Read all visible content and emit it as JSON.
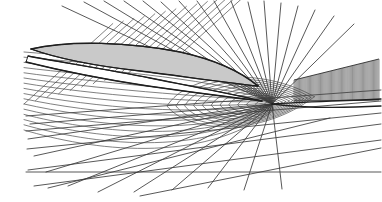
{
  "figure": {
    "title": "Perspective view of a curvilinear computational grid about an airfoil",
    "type": "technical-line-diagram",
    "width": 382,
    "height": 202,
    "background_color": "#ffffff",
    "line_color": "#3a3a3a",
    "heavy_line_color": "#1f1f1f",
    "body_fill_color": "#c9c9c9",
    "body_outline_color": "#2b2b2b",
    "hatch_color": "#4c4c4c"
  },
  "focus": {
    "name": "grid-convergence-point",
    "x": 272,
    "y": 104,
    "label": "singular focus"
  },
  "body": {
    "name": "airfoil-body",
    "fill": "#c9c9c9",
    "nose": {
      "x": 31,
      "y": 49
    },
    "tail": {
      "x": 258,
      "y": 86
    },
    "upper_path": "M31,49 C70,40 130,42 180,52 C212,59 240,71 258,86",
    "lower_path": "M258,86 C228,83 180,76 140,71 C96,66 56,58 31,49",
    "outline_path": "M31,49 C70,40 130,42 180,52 C212,59 240,71 258,86 C228,83 180,76 140,71 C96,66 56,58 31,49 Z"
  },
  "wake": {
    "name": "wake-sheet",
    "fill": "#ffffff",
    "path": "M28,56 C60,62 110,70 150,78 C190,86 232,94 262,101 C236,98 190,92 148,86 C108,80 58,70 26,62 Z",
    "upper_edge": "M28,56 C60,62 110,70 150,78 C190,86 232,94 262,101",
    "lower_edge": "M26,62 C58,70 108,80 148,86 C190,92 236,98 262,101"
  },
  "hatch_panel": {
    "name": "dense-hatched-wedge",
    "comment": "Dense vertical hatching at right, bounded by sloped top edge and near-horizontal bottom edge",
    "x_start": 294,
    "x_end": 379,
    "top_left": {
      "x": 294,
      "y": 80
    },
    "top_right": {
      "x": 379,
      "y": 59
    },
    "bottom_left": {
      "x": 294,
      "y": 101
    },
    "bottom_right": {
      "x": 379,
      "y": 100
    },
    "line_count": 78,
    "stroke_width": 0.6
  },
  "radial_fan_upper": {
    "name": "upper-radial-grid-lines",
    "comment": "Lines radiating up-left from the focus, crossing the body's upper surface and exiting the top of the frame",
    "count": 17,
    "end_points": [
      {
        "x": 62,
        "y": 6
      },
      {
        "x": 84,
        "y": 2
      },
      {
        "x": 104,
        "y": 1
      },
      {
        "x": 124,
        "y": 1
      },
      {
        "x": 143,
        "y": 1
      },
      {
        "x": 161,
        "y": 2
      },
      {
        "x": 179,
        "y": 1
      },
      {
        "x": 197,
        "y": 1
      },
      {
        "x": 214,
        "y": 1
      },
      {
        "x": 231,
        "y": 1
      },
      {
        "x": 248,
        "y": 2
      },
      {
        "x": 264,
        "y": 1
      },
      {
        "x": 281,
        "y": 3
      },
      {
        "x": 298,
        "y": 6
      },
      {
        "x": 315,
        "y": 10
      },
      {
        "x": 334,
        "y": 16
      },
      {
        "x": 354,
        "y": 24
      }
    ]
  },
  "radial_fan_lower": {
    "name": "lower-radial-grid-lines",
    "comment": "Lines radiating down-left from the focus toward the bottom of the frame",
    "count": 11,
    "end_points": [
      {
        "x": 30,
        "y": 124
      },
      {
        "x": 28,
        "y": 139
      },
      {
        "x": 34,
        "y": 156
      },
      {
        "x": 46,
        "y": 172
      },
      {
        "x": 68,
        "y": 186
      },
      {
        "x": 98,
        "y": 192
      },
      {
        "x": 134,
        "y": 192
      },
      {
        "x": 172,
        "y": 190
      },
      {
        "x": 208,
        "y": 188
      },
      {
        "x": 244,
        "y": 190
      },
      {
        "x": 282,
        "y": 189
      }
    ]
  },
  "circumferential_lines": {
    "name": "circumferential-grid-lines",
    "comment": "Near-horizontal grid curves sweeping from the left edge toward the focus region; nested ellipse-like contours",
    "count": 16
  },
  "frame_lines": {
    "name": "outer-frame-grid-lines",
    "comment": "Long straight lines crossing the lower half of the figure",
    "segments": [
      {
        "x1": 26,
        "y1": 116,
        "x2": 381,
        "y2": 90
      },
      {
        "x1": 26,
        "y1": 131,
        "x2": 381,
        "y2": 101
      },
      {
        "x1": 27,
        "y1": 149,
        "x2": 381,
        "y2": 113
      },
      {
        "x1": 28,
        "y1": 170,
        "x2": 381,
        "y2": 124
      },
      {
        "x1": 34,
        "y1": 186,
        "x2": 381,
        "y2": 140
      },
      {
        "x1": 26,
        "y1": 172,
        "x2": 381,
        "y2": 172
      },
      {
        "x1": 140,
        "y1": 196,
        "x2": 381,
        "y2": 148
      },
      {
        "x1": 48,
        "y1": 188,
        "x2": 330,
        "y2": 118
      }
    ]
  },
  "top_diagonals": {
    "name": "upper-diagonal-grid-lines",
    "comment": "Parallel diagonals in the top-left quadrant running lower-left to upper-right",
    "count": 14,
    "slope_note": "approximately 55 degrees from horizontal"
  }
}
